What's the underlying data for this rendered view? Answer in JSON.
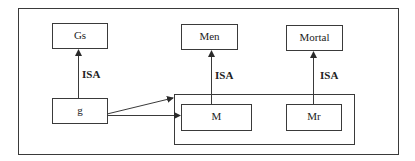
{
  "diagram": {
    "nodes": [
      {
        "id": "gs",
        "label": "Gs"
      },
      {
        "id": "men",
        "label": "Men"
      },
      {
        "id": "mortal",
        "label": "Mortal"
      },
      {
        "id": "g",
        "label": "g"
      },
      {
        "id": "m",
        "label": "M"
      },
      {
        "id": "mr",
        "label": "Mr"
      }
    ],
    "groups": [
      {
        "id": "m-mr-group",
        "members": [
          "m",
          "mr"
        ]
      }
    ],
    "edges": [
      {
        "from": "g",
        "to": "gs",
        "label": "ISA"
      },
      {
        "from": "m",
        "to": "men",
        "label": "ISA"
      },
      {
        "from": "mr",
        "to": "mortal",
        "label": "ISA"
      },
      {
        "from": "g",
        "to": "m-mr-group",
        "label": ""
      },
      {
        "from": "g",
        "to": "m",
        "label": ""
      }
    ],
    "colors": {
      "stroke": "#3a3a3a",
      "text": "#222222",
      "background": "#ffffff"
    }
  }
}
